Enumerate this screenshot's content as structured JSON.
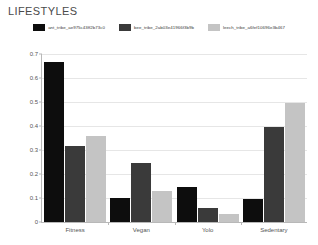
{
  "chart_data": {
    "type": "bar",
    "title": "LIFESTYLES",
    "xlabel": "",
    "ylabel": "",
    "ylim": [
      0,
      0.7
    ],
    "yticks": [
      0,
      0.1,
      0.2,
      0.3,
      0.4,
      0.5,
      0.6,
      0.7
    ],
    "ytick_labels": [
      "0",
      "0.1",
      "0.2",
      "0.3",
      "0.4",
      "0.5",
      "0.6",
      "0.7"
    ],
    "grid": true,
    "legend_position": "top-center",
    "categories": [
      "Fitness",
      "Vegan",
      "Yolo",
      "Sedentary"
    ],
    "series": [
      {
        "name": "ant_tribe_ae975c43ff2b73c0",
        "color": "#0d0d0d",
        "values": [
          0.665,
          0.1,
          0.145,
          0.095
        ]
      },
      {
        "name": "bee_tribe_2ab03e41966f3b9b",
        "color": "#3a3a3a",
        "values": [
          0.315,
          0.245,
          0.06,
          0.395
        ]
      },
      {
        "name": "leech_tribe_a6fef10696e3b467",
        "color": "#c4c4c4",
        "values": [
          0.36,
          0.13,
          0.035,
          0.495
        ]
      }
    ]
  }
}
